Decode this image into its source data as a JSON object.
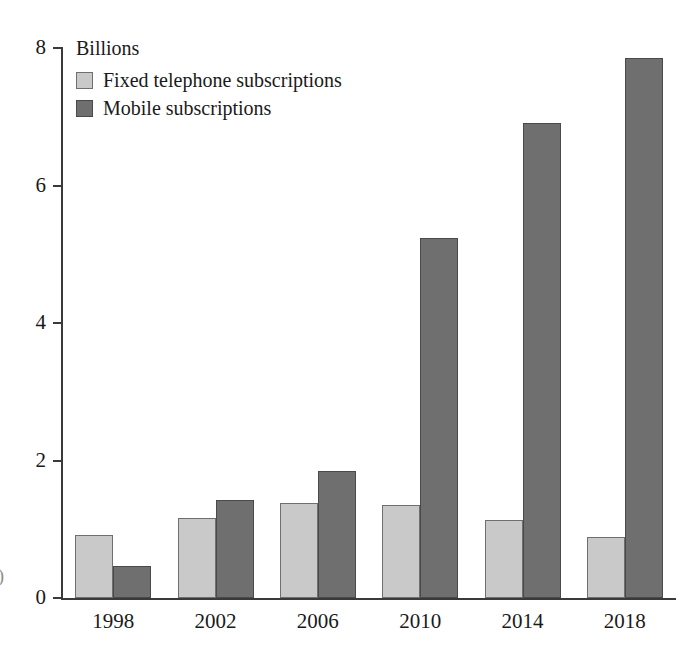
{
  "chart_data": {
    "type": "bar",
    "title": "",
    "subtitle": "",
    "unit_label": "Billions",
    "xlabel": "",
    "ylabel": "",
    "categories": [
      "1998",
      "2002",
      "2006",
      "2010",
      "2014",
      "2018"
    ],
    "series": [
      {
        "name": "Fixed telephone subscriptions",
        "color": "#c9c9c9",
        "border_color": "#6f6f6f",
        "values": [
          0.92,
          1.16,
          1.38,
          1.35,
          1.14,
          0.89
        ]
      },
      {
        "name": "Mobile subscriptions",
        "color": "#6f6f6f",
        "border_color": "#4a4a4a",
        "values": [
          0.46,
          1.42,
          1.85,
          5.24,
          6.91,
          7.85
        ]
      }
    ],
    "ylim": [
      0,
      8
    ],
    "yticks": [
      0,
      2,
      4,
      6,
      8
    ],
    "ytick_labels": [
      "0",
      "2",
      "4",
      "6",
      "8"
    ],
    "grid": false,
    "legend_position": "top-left"
  },
  "legend": {
    "title": "Billions",
    "entries": [
      {
        "label": "Fixed telephone subscriptions",
        "swatch": "light"
      },
      {
        "label": "Mobile subscriptions",
        "swatch": "dark"
      }
    ]
  },
  "artifact": {
    "edge_mark": ")"
  }
}
